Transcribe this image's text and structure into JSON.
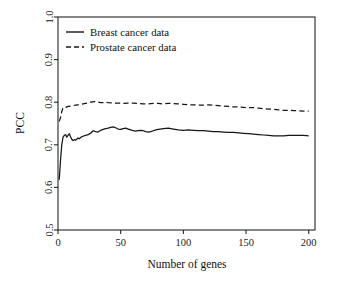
{
  "chart_data": {
    "type": "line",
    "title": "",
    "xlabel": "Number of genes",
    "ylabel": "PCC",
    "xlim": [
      0,
      205
    ],
    "ylim": [
      0.5,
      1.0
    ],
    "grid": false,
    "legend_position": "top-left",
    "xticks": [
      0,
      50,
      100,
      150,
      200
    ],
    "xtick_labels": [
      "0",
      "50",
      "100",
      "150",
      "200"
    ],
    "yticks": [
      0.5,
      0.6,
      0.7,
      0.8,
      0.9,
      1.0
    ],
    "ytick_labels": [
      "0.5",
      "0.6",
      "0.7",
      "0.8",
      "0.9",
      "1.0"
    ],
    "series": [
      {
        "name": "Breast cancer data",
        "style": "solid",
        "color": "#161616",
        "x": [
          1,
          2,
          3,
          4,
          5,
          6,
          7,
          8,
          9,
          10,
          11,
          12,
          13,
          14,
          15,
          16,
          17,
          18,
          19,
          20,
          22,
          24,
          26,
          28,
          30,
          32,
          34,
          36,
          38,
          40,
          42,
          44,
          46,
          48,
          50,
          52,
          54,
          56,
          58,
          60,
          62,
          64,
          66,
          68,
          70,
          72,
          74,
          76,
          78,
          80,
          84,
          88,
          92,
          96,
          100,
          104,
          108,
          112,
          116,
          120,
          124,
          128,
          132,
          136,
          140,
          144,
          148,
          152,
          156,
          160,
          164,
          168,
          172,
          176,
          180,
          184,
          188,
          192,
          196,
          200
        ],
        "y": [
          0.618,
          0.663,
          0.7,
          0.718,
          0.722,
          0.724,
          0.718,
          0.722,
          0.726,
          0.719,
          0.713,
          0.71,
          0.712,
          0.711,
          0.713,
          0.716,
          0.714,
          0.717,
          0.719,
          0.72,
          0.722,
          0.724,
          0.727,
          0.733,
          0.731,
          0.73,
          0.734,
          0.736,
          0.738,
          0.739,
          0.741,
          0.742,
          0.74,
          0.737,
          0.736,
          0.738,
          0.739,
          0.737,
          0.735,
          0.733,
          0.732,
          0.733,
          0.734,
          0.733,
          0.731,
          0.73,
          0.731,
          0.733,
          0.735,
          0.736,
          0.738,
          0.739,
          0.737,
          0.735,
          0.734,
          0.735,
          0.734,
          0.733,
          0.733,
          0.732,
          0.731,
          0.731,
          0.73,
          0.729,
          0.729,
          0.728,
          0.727,
          0.726,
          0.725,
          0.724,
          0.723,
          0.722,
          0.721,
          0.721,
          0.721,
          0.722,
          0.722,
          0.722,
          0.722,
          0.721
        ]
      },
      {
        "name": "Prostate cancer data",
        "style": "dashed",
        "color": "#161616",
        "x": [
          1,
          2,
          3,
          4,
          5,
          6,
          7,
          8,
          9,
          10,
          12,
          14,
          16,
          18,
          20,
          22,
          24,
          26,
          28,
          30,
          32,
          34,
          36,
          38,
          40,
          44,
          48,
          52,
          56,
          60,
          64,
          68,
          72,
          76,
          80,
          84,
          88,
          92,
          96,
          100,
          104,
          108,
          112,
          116,
          120,
          124,
          128,
          132,
          136,
          140,
          144,
          148,
          152,
          156,
          160,
          164,
          168,
          172,
          176,
          180,
          184,
          188,
          192,
          196,
          200
        ],
        "y": [
          0.755,
          0.764,
          0.778,
          0.786,
          0.788,
          0.787,
          0.789,
          0.79,
          0.79,
          0.791,
          0.792,
          0.793,
          0.794,
          0.795,
          0.796,
          0.797,
          0.798,
          0.8,
          0.801,
          0.802,
          0.8,
          0.799,
          0.799,
          0.8,
          0.799,
          0.798,
          0.798,
          0.797,
          0.798,
          0.798,
          0.797,
          0.796,
          0.796,
          0.797,
          0.797,
          0.796,
          0.797,
          0.797,
          0.796,
          0.795,
          0.794,
          0.794,
          0.793,
          0.793,
          0.794,
          0.793,
          0.792,
          0.791,
          0.79,
          0.789,
          0.789,
          0.788,
          0.787,
          0.787,
          0.786,
          0.785,
          0.784,
          0.783,
          0.782,
          0.781,
          0.781,
          0.78,
          0.78,
          0.779,
          0.779
        ]
      }
    ]
  },
  "legend": {
    "entries": [
      {
        "label": "Breast cancer data",
        "style": "solid"
      },
      {
        "label": "Prostate cancer data",
        "style": "dashed"
      }
    ]
  }
}
